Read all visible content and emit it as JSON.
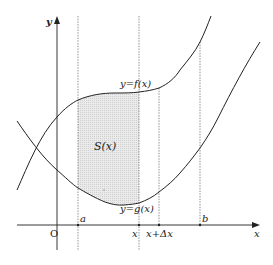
{
  "diagram": {
    "axes": {
      "x_label": "x",
      "y_label": "y",
      "origin_label": "O"
    },
    "curves": [
      {
        "name": "f",
        "label": "y=f(x)"
      },
      {
        "name": "g",
        "label": "y=g(x)"
      }
    ],
    "region_label": "S(x)",
    "vertical_markers": [
      {
        "name": "a",
        "label": "a"
      },
      {
        "name": "x",
        "label": "x"
      },
      {
        "name": "x-plus-dx",
        "label": "x+Δx"
      },
      {
        "name": "b",
        "label": "b"
      }
    ],
    "colors": {
      "stroke": "#222222",
      "dashed": "#777777",
      "shade": "#d9d9d9"
    }
  }
}
